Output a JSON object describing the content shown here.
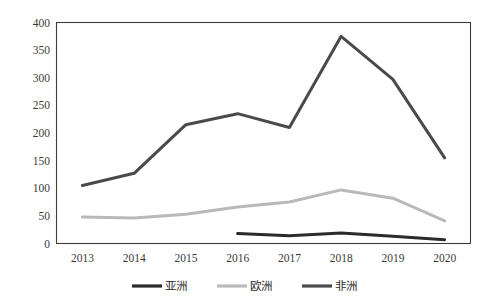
{
  "chart_data": {
    "type": "line",
    "title": "",
    "subtitle": "",
    "xlabel": "",
    "ylabel": "",
    "categories": [
      "2013",
      "2014",
      "2015",
      "2016",
      "2017",
      "2018",
      "2019",
      "2020"
    ],
    "ylim": [
      0,
      400
    ],
    "yticks": [
      0,
      50,
      100,
      150,
      200,
      250,
      300,
      350,
      400
    ],
    "ytick_labels": [
      "0",
      "50",
      "100",
      "150",
      "200",
      "250",
      "300",
      "350",
      "400"
    ],
    "grid": false,
    "legend_position": "bottom",
    "series": [
      {
        "name": "亚洲",
        "color": "#2b2b2b",
        "width": 3.0,
        "values": [
          null,
          null,
          null,
          18,
          14,
          19,
          13,
          7
        ]
      },
      {
        "name": "欧洲",
        "color": "#b9b9b9",
        "width": 3.0,
        "values": [
          48,
          46,
          53,
          66,
          75,
          97,
          82,
          41
        ]
      },
      {
        "name": "非洲",
        "color": "#4a4a4a",
        "width": 3.0,
        "values": [
          105,
          127,
          215,
          235,
          210,
          375,
          297,
          155
        ]
      }
    ]
  },
  "legend": {
    "items": [
      {
        "label": "亚洲",
        "color": "#2b2b2b"
      },
      {
        "label": "欧洲",
        "color": "#b9b9b9"
      },
      {
        "label": "非洲",
        "color": "#4a4a4a"
      }
    ]
  },
  "axes": {
    "y_labels": [
      "400",
      "350",
      "300",
      "250",
      "200",
      "150",
      "100",
      "50",
      "0"
    ],
    "x_labels": [
      "2013",
      "2014",
      "2015",
      "2016",
      "2017",
      "2018",
      "2019",
      "2020"
    ]
  }
}
